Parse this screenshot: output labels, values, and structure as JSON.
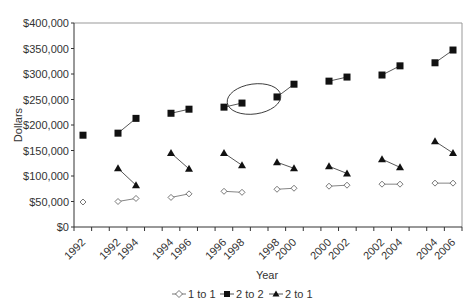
{
  "chart_data": {
    "type": "line",
    "title": "",
    "xlabel": "Year",
    "ylabel": "Dollars",
    "ylim": [
      0,
      400000
    ],
    "y_ticks": [
      "$0",
      "$50,000",
      "$100,000",
      "$150,000",
      "$200,000",
      "$250,000",
      "$300,000",
      "$350,000",
      "$400,000"
    ],
    "x_tick_labels": [
      "1992",
      "1992",
      "1994",
      "1994",
      "1996",
      "1996",
      "1998",
      "1998",
      "2000",
      "2000",
      "2002",
      "2002",
      "2004",
      "2004",
      "2006"
    ],
    "grid": false,
    "legend_position": "bottom",
    "annotation": "ellipse around 2 to 2 points at 1998 (end of 1996-1998 pair) and 1998 (start of 1998-2000 pair)",
    "groups": [
      {
        "label": "1992",
        "years": [
          "1992"
        ]
      },
      {
        "label": "1992-1994",
        "years": [
          "1992",
          "1994"
        ]
      },
      {
        "label": "1994-1996",
        "years": [
          "1994",
          "1996"
        ]
      },
      {
        "label": "1996-1998",
        "years": [
          "1996",
          "1998"
        ]
      },
      {
        "label": "1998-2000",
        "years": [
          "1998",
          "2000"
        ]
      },
      {
        "label": "2000-2002",
        "years": [
          "2000",
          "2002"
        ]
      },
      {
        "label": "2002-2004",
        "years": [
          "2002",
          "2004"
        ]
      },
      {
        "label": "2004-2006",
        "years": [
          "2004",
          "2006"
        ]
      }
    ],
    "series": [
      {
        "name": "1 to 1",
        "marker": "open-diamond",
        "values": [
          [
            49000
          ],
          [
            50000,
            56000
          ],
          [
            58000,
            65000
          ],
          [
            70000,
            68000
          ],
          [
            74000,
            76000
          ],
          [
            80000,
            82000
          ],
          [
            84000,
            84000
          ],
          [
            86000,
            86000
          ]
        ]
      },
      {
        "name": "2 to 2",
        "marker": "filled-square",
        "values": [
          [
            180000
          ],
          [
            184000,
            213000
          ],
          [
            223000,
            231000
          ],
          [
            235000,
            243000
          ],
          [
            255000,
            280000
          ],
          [
            286000,
            294000
          ],
          [
            298000,
            316000
          ],
          [
            322000,
            347000
          ]
        ]
      },
      {
        "name": "2 to 1",
        "marker": "filled-triangle",
        "values": [
          [],
          [
            115000,
            82000
          ],
          [
            145000,
            114000
          ],
          [
            145000,
            121000
          ],
          [
            127000,
            115000
          ],
          [
            119000,
            105000
          ],
          [
            133000,
            117000
          ],
          [
            168000,
            145000
          ]
        ]
      }
    ]
  },
  "legend": {
    "items": [
      {
        "label": "1 to 1"
      },
      {
        "label": "2 to 2"
      },
      {
        "label": "2 to 1"
      }
    ]
  }
}
